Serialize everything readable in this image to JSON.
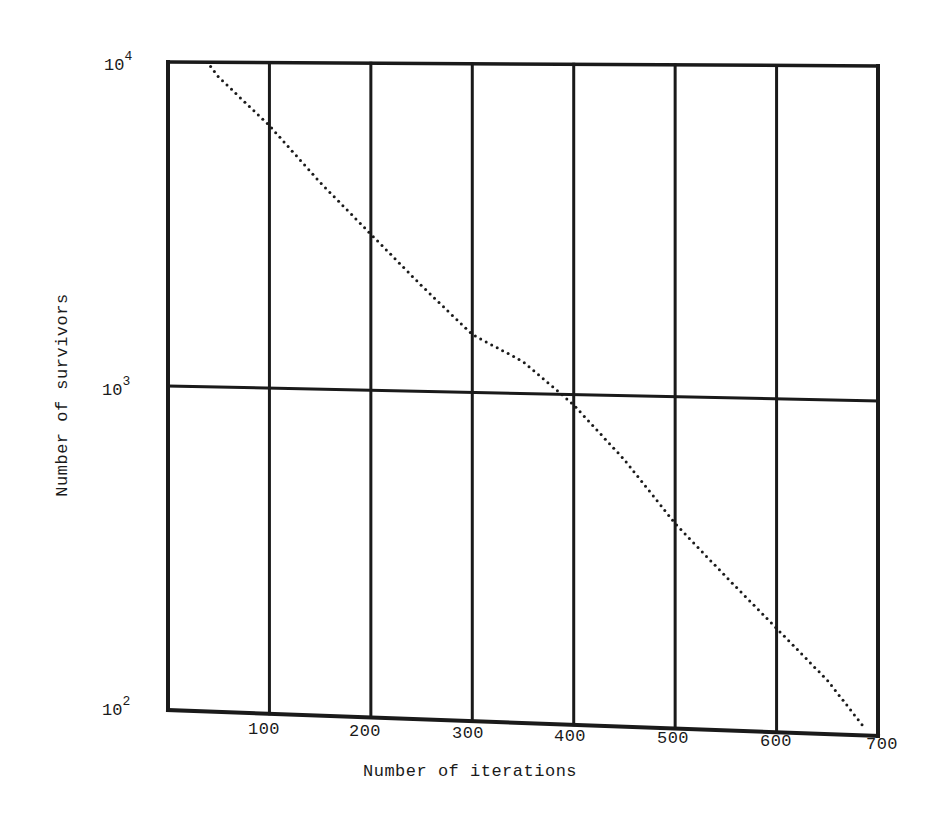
{
  "chart_data": {
    "type": "scatter",
    "style": "dotted-line",
    "title": "",
    "xlabel": "Number of iterations",
    "ylabel": "Number of survivors",
    "xscale": "linear",
    "yscale": "log",
    "xlim": [
      0,
      700
    ],
    "ylim": [
      100,
      10000
    ],
    "grid": true,
    "legend": null,
    "x_ticks": [
      {
        "value": 100,
        "label": "100"
      },
      {
        "value": 200,
        "label": "200"
      },
      {
        "value": 300,
        "label": "300"
      },
      {
        "value": 400,
        "label": "400"
      },
      {
        "value": 500,
        "label": "500"
      },
      {
        "value": 600,
        "label": "600"
      },
      {
        "value": 700,
        "label": "700"
      }
    ],
    "y_ticks": [
      {
        "value": 100,
        "base": "10",
        "exp": "2"
      },
      {
        "value": 1000,
        "base": "10",
        "exp": "3"
      },
      {
        "value": 10000,
        "base": "10",
        "exp": "4"
      }
    ],
    "series": [
      {
        "name": "survivors",
        "x": [
          42,
          50,
          100,
          150,
          200,
          250,
          300,
          350,
          388,
          400,
          450,
          500,
          550,
          600,
          650,
          685
        ],
        "values": [
          9700,
          9000,
          6400,
          4300,
          3000,
          2100,
          1500,
          1250,
          1000,
          930,
          640,
          415,
          290,
          205,
          145,
          107
        ]
      }
    ]
  },
  "axes": {
    "x_title": "Number of iterations",
    "y_title": "Number of survivors"
  },
  "colors": {
    "ink": "#1a1a1a",
    "background": "#ffffff"
  }
}
